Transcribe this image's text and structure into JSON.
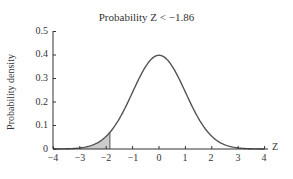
{
  "chart_data": {
    "type": "line",
    "title": "Probability Z < −1.86",
    "xlabel": "Z",
    "ylabel": "Probability density",
    "xlim": [
      -4,
      4
    ],
    "ylim": [
      0,
      0.5
    ],
    "x_ticks": [
      "−4",
      "−3",
      "−2",
      "−1",
      "0",
      "1",
      "2",
      "3",
      "4"
    ],
    "y_ticks": [
      "0",
      "0.1",
      "0.2",
      "0.3",
      "0.4",
      "0.5"
    ],
    "grid": false,
    "legend": null,
    "series": [
      {
        "name": "Standard normal density",
        "x": [
          -4,
          -3,
          -2,
          -1.86,
          -1,
          0,
          1,
          2,
          3,
          4
        ],
        "values": [
          0.0001,
          0.0044,
          0.054,
          0.0707,
          0.242,
          0.399,
          0.242,
          0.054,
          0.0044,
          0.0001
        ]
      }
    ],
    "shaded_region": {
      "from": -4,
      "to": -1.86,
      "color": "#cccccc",
      "label": "P(Z < −1.86)"
    },
    "colors": {
      "curve": "#555555",
      "axis": "#333333",
      "shade": "#cccccc"
    }
  }
}
